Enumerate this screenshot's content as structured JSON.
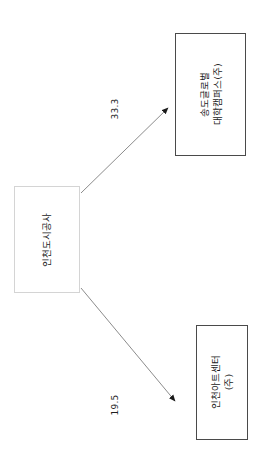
{
  "diagram": {
    "type": "ownership-structure",
    "orientation": "rotated-90-ccw",
    "nodes": [
      {
        "id": "parent",
        "name": "인천도시공사",
        "role": "parent",
        "border_color": "#d4d4d4"
      },
      {
        "id": "sub-top",
        "name_line1": "송도글로벌",
        "name_line2": "대학캠퍼스(주)",
        "role": "subsidiary",
        "border_color": "#4a4a4a"
      },
      {
        "id": "sub-bottom",
        "name_line1": "인천아트센터",
        "name_line2": "(주)",
        "role": "subsidiary",
        "border_color": "#4a4a4a"
      }
    ],
    "edges": [
      {
        "id": "edge-top",
        "from": "parent",
        "to": "sub-top",
        "value": "33.3"
      },
      {
        "id": "edge-bottom",
        "from": "parent",
        "to": "sub-bottom",
        "value": "19.5"
      }
    ],
    "line_color": "#8c8c8c",
    "arrow_color": "#1a1a1a"
  }
}
